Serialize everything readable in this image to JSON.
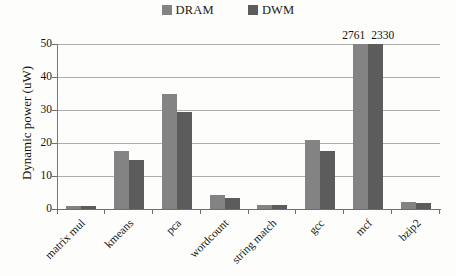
{
  "chart_data": {
    "type": "bar",
    "title": "",
    "subtitle": "",
    "xlabel": "",
    "ylabel": "Dynamic power (uW)",
    "ylim": [
      0,
      50
    ],
    "yticks": [
      0,
      10,
      20,
      30,
      40,
      50
    ],
    "ytick_labels": [
      "0",
      "10",
      "20",
      "30",
      "40",
      "50"
    ],
    "grid": "horizontal",
    "legend_position": "top-center",
    "categories": [
      "matrix mul",
      "kmeans",
      "pca",
      "wordcount",
      "string match",
      "gcc",
      "mcf",
      "bzip2"
    ],
    "series": [
      {
        "name": "DRAM",
        "color": "#838383",
        "values": [
          1.0,
          17.5,
          35.0,
          4.2,
          1.2,
          21.0,
          2761,
          2.0
        ]
      },
      {
        "name": "DWM",
        "color": "#5c5c5c",
        "values": [
          0.9,
          14.8,
          29.5,
          3.3,
          1.1,
          17.5,
          2330,
          1.8
        ]
      }
    ],
    "annotations": [
      {
        "category": "mcf",
        "series": "DRAM",
        "text": "2761",
        "note": "bar clipped at axis maximum"
      },
      {
        "category": "mcf",
        "series": "DWM",
        "text": "2330",
        "note": "bar clipped at axis maximum"
      }
    ]
  },
  "legend": {
    "items": [
      {
        "label": "DRAM",
        "color": "#838383"
      },
      {
        "label": "DWM",
        "color": "#5c5c5c"
      }
    ]
  },
  "axes": {
    "y_title": "Dynamic power (uW)",
    "y_ticks": [
      "50",
      "40",
      "30",
      "20",
      "10",
      "0"
    ],
    "x_categories": [
      "matrix mul",
      "kmeans",
      "pca",
      "wordcount",
      "string match",
      "gcc",
      "mcf",
      "bzip2"
    ]
  },
  "overflow_labels": [
    "2761",
    "2330"
  ]
}
